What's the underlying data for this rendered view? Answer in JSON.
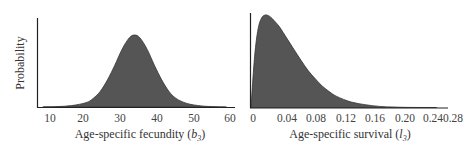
{
  "chart_data": [
    {
      "type": "area",
      "title": "",
      "xlabel": "Age-specific fecundity",
      "xlabel_symbol": "b",
      "xlabel_subscript": "3",
      "ylabel": "Probability",
      "x_ticks": [
        10,
        20,
        30,
        40,
        50,
        60
      ],
      "xlim": [
        6.5,
        61
      ],
      "grid": false,
      "legend": null,
      "distribution": "approximately normal",
      "x": [
        8,
        12,
        16,
        20,
        22,
        24,
        26,
        28,
        30,
        32,
        33.5,
        35,
        37,
        39,
        41,
        43,
        45,
        48,
        52,
        56,
        59
      ],
      "values": [
        0.0,
        0.005,
        0.02,
        0.06,
        0.12,
        0.22,
        0.38,
        0.58,
        0.8,
        0.96,
        1.0,
        0.96,
        0.8,
        0.58,
        0.38,
        0.22,
        0.12,
        0.05,
        0.015,
        0.004,
        0.0
      ],
      "fill_color": "#555555"
    },
    {
      "type": "area",
      "title": "",
      "xlabel": "Age-specific survival",
      "xlabel_symbol": "l",
      "xlabel_subscript": "3",
      "ylabel": "",
      "x_ticks": [
        "0",
        "0.04",
        "0.08",
        "0.12",
        "0.16",
        "0.20",
        "0.24",
        "0.28"
      ],
      "xlim": [
        0,
        0.275
      ],
      "grid": false,
      "legend": null,
      "distribution": "right-skewed",
      "x": [
        0,
        0.005,
        0.01,
        0.015,
        0.02,
        0.025,
        0.03,
        0.04,
        0.05,
        0.06,
        0.07,
        0.08,
        0.09,
        0.1,
        0.11,
        0.12,
        0.14,
        0.16,
        0.18,
        0.2,
        0.22,
        0.26
      ],
      "values": [
        0.0,
        0.55,
        0.85,
        0.97,
        1.0,
        0.99,
        0.96,
        0.87,
        0.75,
        0.63,
        0.51,
        0.4,
        0.31,
        0.23,
        0.17,
        0.12,
        0.06,
        0.03,
        0.012,
        0.005,
        0.001,
        0.0
      ],
      "fill_color": "#555555"
    }
  ],
  "left": {
    "ylabel": "Probability",
    "xlabel_text": "Age-specific fecundity (",
    "xlabel_sym": "b",
    "xlabel_sub": "3",
    "xlabel_close": ")",
    "ticks": [
      "10",
      "20",
      "30",
      "40",
      "50",
      "60"
    ]
  },
  "right": {
    "xlabel_text": "Age-specific survival (",
    "xlabel_sym": "l",
    "xlabel_sub": "3",
    "xlabel_close": ")",
    "ticks": [
      "0",
      "0.04",
      "0.08",
      "0.12",
      "0.16",
      "0.20",
      "0.24",
      "0.28"
    ]
  }
}
